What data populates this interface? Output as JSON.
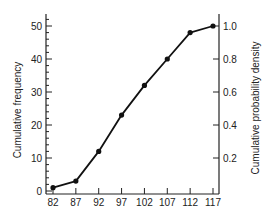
{
  "chart_data": {
    "type": "line",
    "title": "",
    "xlabel": "",
    "ylabel": "Cumulative frequency",
    "ylabel_right": "Cumulative probability density",
    "x": [
      82,
      87,
      92,
      97,
      102,
      107,
      112,
      117
    ],
    "series": [
      {
        "name": "Cumulative frequency",
        "values": [
          1,
          3,
          12,
          23,
          32,
          40,
          48,
          50
        ]
      }
    ],
    "xticks": [
      "82",
      "87",
      "92",
      "97",
      "102",
      "107",
      "112",
      "117"
    ],
    "yticks_left": [
      "0",
      "10",
      "20",
      "30",
      "40",
      "50"
    ],
    "yticks_right": [
      "0.2",
      "0.4",
      "0.6",
      "0.8",
      "1.0"
    ],
    "ylim": [
      0,
      53
    ],
    "ylim_right": [
      0,
      1.06
    ],
    "grid": false,
    "legend": "none",
    "marker": "filled-circle",
    "color": "#111111"
  }
}
